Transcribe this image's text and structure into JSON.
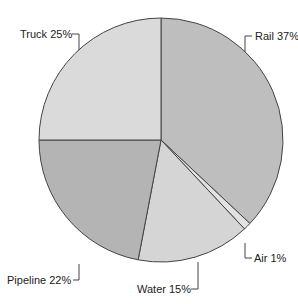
{
  "chart_data": {
    "type": "pie",
    "title": "",
    "categories": [
      "Rail",
      "Air",
      "Water",
      "Pipeline",
      "Truck"
    ],
    "values": [
      37,
      1,
      15,
      22,
      25
    ],
    "unit": "%",
    "start_angle_deg_from_top_clockwise": 0,
    "labels": [
      "Rail 37%",
      "Air 1%",
      "Water 15%",
      "Pipeline 22%",
      "Truck 25%"
    ],
    "colors": [
      "#bebebe",
      "#e2e2e2",
      "#d5d5d5",
      "#b4b4b4",
      "#dadada"
    ],
    "legend": "none (callout labels)"
  },
  "labels": {
    "rail": "Rail 37%",
    "air": "Air 1%",
    "water": "Water 15%",
    "pipeline": "Pipeline 22%",
    "truck": "Truck 25%"
  }
}
